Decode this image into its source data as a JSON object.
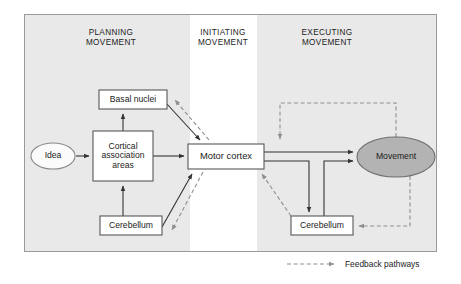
{
  "figure": {
    "frame": {
      "x": 24,
      "y": 14,
      "width": 413,
      "height": 238
    },
    "background_color": "#e9e9e9",
    "highlight_band_color": "#ffffff",
    "border_color": "#8d8d8d"
  },
  "phases": [
    {
      "id": "planning",
      "line1": "PLANNING",
      "line2": "MOVEMENT",
      "center_x": 111,
      "top_y": 28
    },
    {
      "id": "initiating",
      "line1": "INITIATING",
      "line2": "MOVEMENT",
      "center_x": 223,
      "top_y": 28
    },
    {
      "id": "executing",
      "line1": "EXECUTING",
      "line2": "MOVEMENT",
      "center_x": 327,
      "top_y": 28
    }
  ],
  "nodes": [
    {
      "id": "idea",
      "label": "Idea",
      "shape": "ellipse",
      "fill": "#fbfbfb",
      "stroke": "#8a8a8a",
      "cx": 53,
      "cy": 156,
      "rx": 22,
      "ry": 13
    },
    {
      "id": "cortical-association-areas",
      "label": "Cortical association areas",
      "label_lines": [
        "Cortical",
        "association",
        "areas"
      ],
      "shape": "rect",
      "fill": "#ffffff",
      "stroke": "#585858",
      "x": 93,
      "y": 131,
      "width": 60,
      "height": 50
    },
    {
      "id": "basal-nuclei",
      "label": "Basal nuclei",
      "label_lines": [
        "Basal nuclei"
      ],
      "shape": "rect",
      "fill": "#ffffff",
      "stroke": "#585858",
      "x": 99,
      "y": 90,
      "width": 68,
      "height": 19
    },
    {
      "id": "cerebellum-left",
      "label": "Cerebellum",
      "label_lines": [
        "Cerebellum"
      ],
      "shape": "rect",
      "fill": "#ffffff",
      "stroke": "#585858",
      "x": 100,
      "y": 216,
      "width": 62,
      "height": 19
    },
    {
      "id": "motor-cortex",
      "label": "Motor cortex",
      "label_lines": [
        "Motor cortex"
      ],
      "shape": "rect",
      "fill": "#ffffff",
      "stroke": "#585858",
      "x": 188,
      "y": 144,
      "width": 76,
      "height": 25
    },
    {
      "id": "cerebellum-right",
      "label": "Cerebellum",
      "label_lines": [
        "Cerebellum"
      ],
      "shape": "rect",
      "fill": "#ffffff",
      "stroke": "#585858",
      "x": 291,
      "y": 216,
      "width": 62,
      "height": 19
    },
    {
      "id": "movement",
      "label": "Movement",
      "shape": "ellipse",
      "fill": "#b3b3b3",
      "stroke": "#6e6e6e",
      "cx": 396,
      "cy": 157,
      "rx": 39,
      "ry": 20
    }
  ],
  "edges": [
    {
      "id": "idea-to-cortical",
      "type": "solid",
      "from": "idea",
      "to": "cortical-association-areas"
    },
    {
      "id": "cortical-to-basal",
      "type": "solid",
      "from": "cortical-association-areas",
      "to": "basal-nuclei"
    },
    {
      "id": "cerebellum-left-to-cortical",
      "type": "solid",
      "from": "cerebellum-left",
      "to": "cortical-association-areas"
    },
    {
      "id": "cortical-to-motor",
      "type": "solid",
      "from": "cortical-association-areas",
      "to": "motor-cortex"
    },
    {
      "id": "basal-to-motor",
      "type": "solid",
      "from": "basal-nuclei",
      "to": "motor-cortex"
    },
    {
      "id": "motor-to-basal-feedback",
      "type": "dashed",
      "from": "motor-cortex",
      "to": "basal-nuclei"
    },
    {
      "id": "cerebellum-left-to-motor",
      "type": "solid",
      "from": "cerebellum-left",
      "to": "motor-cortex"
    },
    {
      "id": "motor-to-cerebellum-left-fb",
      "type": "dashed",
      "from": "motor-cortex",
      "to": "cerebellum-left"
    },
    {
      "id": "motor-to-movement-upper",
      "type": "solid",
      "from": "motor-cortex",
      "to": "movement"
    },
    {
      "id": "motor-to-cerebellum-right",
      "type": "solid",
      "from": "motor-cortex",
      "to": "cerebellum-right"
    },
    {
      "id": "cerebellum-right-to-movement",
      "type": "solid",
      "from": "cerebellum-right",
      "to": "movement"
    },
    {
      "id": "movement-to-motor-feedback",
      "type": "dashed",
      "from": "movement",
      "to": "motor-cortex"
    },
    {
      "id": "movement-to-cerebellum-right-fb",
      "type": "dashed",
      "from": "movement",
      "to": "cerebellum-right"
    },
    {
      "id": "cerebellum-right-to-motor-fb",
      "type": "dashed",
      "from": "cerebellum-right",
      "to": "motor-cortex"
    }
  ],
  "legend": {
    "label": "Feedback pathways",
    "line_style": "dashed",
    "arrow_x1": 287,
    "arrow_x2": 337,
    "arrow_y": 264,
    "text_x": 345,
    "text_y": 259
  },
  "colors": {
    "solid_line": "#333333",
    "dashed_line": "#8f8f8f",
    "text": "#1b1b1b"
  }
}
